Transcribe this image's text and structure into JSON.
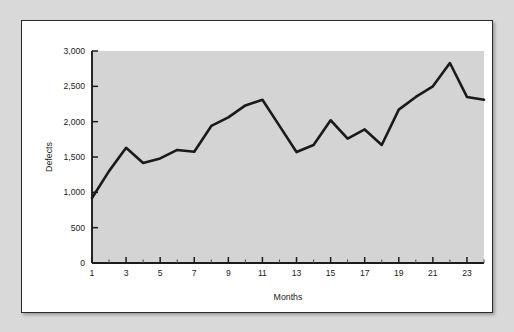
{
  "figure": {
    "background_color": "#d9d9d9",
    "card_color": "#ffffff",
    "border_color": "#2a2a2a"
  },
  "chart_data": {
    "type": "line",
    "title": "",
    "xlabel": "Months",
    "ylabel": "Defects",
    "x": [
      1,
      2,
      3,
      4,
      5,
      6,
      7,
      8,
      9,
      10,
      11,
      12,
      13,
      14,
      15,
      16,
      17,
      18,
      19,
      20,
      21,
      22,
      23,
      24
    ],
    "values": [
      920,
      1300,
      1630,
      1415,
      1480,
      1600,
      1575,
      1940,
      2060,
      2230,
      2310,
      1940,
      1570,
      1670,
      2020,
      1760,
      1890,
      1670,
      2170,
      2350,
      2500,
      2830,
      2350,
      2310
    ],
    "series": [
      {
        "name": "Defects",
        "values": [
          920,
          1300,
          1630,
          1415,
          1480,
          1600,
          1575,
          1940,
          2060,
          2230,
          2310,
          1940,
          1570,
          1670,
          2020,
          1760,
          1890,
          1670,
          2170,
          2350,
          2500,
          2830,
          2350,
          2310
        ]
      }
    ],
    "xlim": [
      1,
      24
    ],
    "ylim": [
      0,
      3000
    ],
    "y_ticks": [
      0,
      500,
      1000,
      1500,
      2000,
      2500,
      3000
    ],
    "y_tick_labels": [
      "0",
      "500",
      "1,000",
      "1,500",
      "2,000",
      "2,500",
      "3,000"
    ],
    "x_ticks": [
      1,
      3,
      5,
      7,
      9,
      11,
      13,
      15,
      17,
      19,
      21,
      23
    ],
    "x_tick_labels": [
      "1",
      "3",
      "5",
      "7",
      "9",
      "11",
      "13",
      "15",
      "17",
      "19",
      "21",
      "23"
    ],
    "x_minor_ticks": [
      2,
      4,
      6,
      8,
      10,
      12,
      14,
      16,
      18,
      20,
      22,
      24
    ],
    "grid": false,
    "legend": "none",
    "line_color": "#1a1a1a",
    "plot_background_color": "#d4d4d4"
  }
}
